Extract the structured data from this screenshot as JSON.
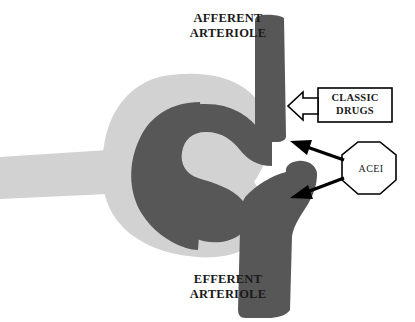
{
  "diagram": {
    "title_top": "AFFERENT\nARTERIOLE",
    "title_bottom": "EFFERENT\nARTERIOLE",
    "classic_drugs_label": "CLASSIC\nDRUGS",
    "acei_label": "ACEI",
    "colors": {
      "background": "#ffffff",
      "vessel_dark": "#575757",
      "capsule_light": "#d2d2d2",
      "outline": "#000000",
      "text": "#1a1a1a",
      "lumen_white": "#ffffff"
    },
    "structures": [
      {
        "name": "afferent-arteriole",
        "label": "AFFERENT ARTERIOLE",
        "description": "Thick dark vessel descending from top, entering glomerulus"
      },
      {
        "name": "efferent-arteriole",
        "label": "EFFERENT ARTERIOLE",
        "description": "Thick dark vessel exiting glomerulus and descending to bottom"
      },
      {
        "name": "glomerular-capillary-loop",
        "label": "",
        "description": "Dark S-shaped capillary loop inside the capsule"
      },
      {
        "name": "bowmans-capsule",
        "label": "",
        "description": "Light gray rounded capsule surrounding the capillary loop"
      },
      {
        "name": "renal-tubule",
        "label": "",
        "description": "Light gray tubule extending to the left edge"
      }
    ],
    "annotations": [
      {
        "name": "classic-drugs-callout",
        "text": "CLASSIC\nDRUGS",
        "shape": "rectangle",
        "arrow_style": "hollow-outlined-block-arrow",
        "arrow_direction": "left",
        "target": "afferent-arteriole"
      },
      {
        "name": "acei-callout",
        "text": "ACEI",
        "shape": "octagon",
        "arrow_style": "solid-black-arrow",
        "arrow_count": 2,
        "arrow_direction": "left",
        "targets": [
          "afferent-arteriole",
          "efferent-arteriole"
        ]
      }
    ]
  }
}
